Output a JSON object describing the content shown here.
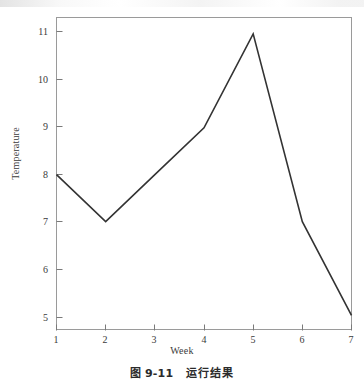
{
  "figure": {
    "caption_number": "图 9-11",
    "caption_text": "运行结果"
  },
  "chart_data": {
    "type": "line",
    "title": "",
    "xlabel": "Week",
    "ylabel": "Temperature",
    "x": [
      1,
      2,
      3,
      4,
      5,
      6,
      7
    ],
    "values": [
      8,
      7,
      8,
      9,
      11,
      7,
      5
    ],
    "series": [
      {
        "name": "Temperature",
        "values": [
          8,
          7,
          8,
          9,
          11,
          7,
          5
        ]
      }
    ],
    "categories": [
      "1",
      "2",
      "3",
      "4",
      "5",
      "6",
      "7"
    ],
    "xlim": [
      1,
      7
    ],
    "ylim": [
      4.7,
      11.35
    ],
    "xticks": [
      "1",
      "2",
      "3",
      "4",
      "5",
      "6",
      "7"
    ],
    "yticks": [
      "5",
      "6",
      "7",
      "8",
      "9",
      "10",
      "11"
    ],
    "grid": false,
    "legend": false,
    "legend_position": "none",
    "line_color": "#333333",
    "frame_color": "#9a9a9a",
    "markers": false
  }
}
